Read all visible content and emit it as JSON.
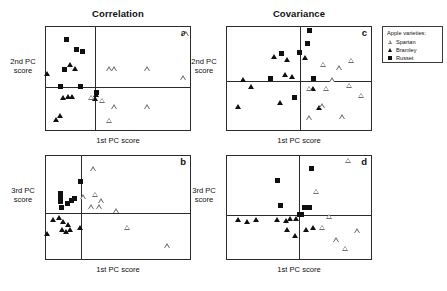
{
  "figure": {
    "column_titles": [
      {
        "label": "Correlation"
      },
      {
        "label": "Covariance"
      }
    ],
    "x_axis_label": "1st PC score",
    "y_axis_label_top": "2nd PC\nscore",
    "y_axis_label_top_line1": "2nd PC",
    "y_axis_label_top_line2": "score",
    "y_axis_label_bottom_line1": "3rd PC",
    "y_axis_label_bottom_line2": "score"
  },
  "legend": {
    "title": "Apple varieties:",
    "entries": [
      {
        "label": "Spartan",
        "marker": "open-triangle-icon",
        "color": "#777777"
      },
      {
        "label": "Bramley",
        "marker": "filled-triangle-icon",
        "color": "#101010"
      },
      {
        "label": "Russet",
        "marker": "filled-square-icon",
        "color": "#101010"
      }
    ]
  },
  "chart_data": [
    {
      "id": "a",
      "type": "scatter",
      "title": "Correlation",
      "panel_label": "a",
      "xlabel": "1st PC score",
      "ylabel": "2nd PC score",
      "xlim": [
        0,
        100
      ],
      "ylim": [
        0,
        100
      ],
      "origin": {
        "x": 34,
        "y": 58
      },
      "grid": false,
      "series": [
        {
          "name": "Russet",
          "marker": "filled-square",
          "points": [
            [
              14,
              12
            ],
            [
              21,
              22
            ],
            [
              25,
              24
            ],
            [
              13,
              41
            ],
            [
              10,
              58
            ],
            [
              24,
              58
            ],
            [
              35,
              64
            ]
          ]
        },
        {
          "name": "Bramley",
          "marker": "filled-triangle",
          "points": [
            [
              17,
              37
            ],
            [
              20,
              41
            ],
            [
              1,
              46
            ],
            [
              12,
              69
            ],
            [
              15,
              68
            ],
            [
              18,
              68
            ],
            [
              35,
              66
            ],
            [
              34,
              70
            ],
            [
              7,
              90
            ],
            [
              10,
              87
            ]
          ]
        },
        {
          "name": "Spartan",
          "marker": "open-triangle",
          "points": [
            [
              44,
              41
            ],
            [
              47,
              41
            ],
            [
              70,
              41
            ],
            [
              95,
              50
            ],
            [
              97,
              7
            ],
            [
              31,
              69
            ],
            [
              39,
              72
            ],
            [
              47,
              78
            ],
            [
              70,
              78
            ],
            [
              44,
              91
            ]
          ]
        }
      ]
    },
    {
      "id": "c",
      "type": "scatter",
      "title": "Covariance",
      "panel_label": "c",
      "xlabel": "1st PC score",
      "ylabel": "2nd PC score",
      "xlim": [
        0,
        100
      ],
      "ylim": [
        0,
        100
      ],
      "origin": {
        "x": 51,
        "y": 52
      },
      "grid": false,
      "series": [
        {
          "name": "Russet",
          "marker": "filled-square",
          "points": [
            [
              57,
              3
            ],
            [
              56,
              16
            ],
            [
              38,
              26
            ],
            [
              50,
              25
            ],
            [
              30,
              50
            ],
            [
              60,
              50
            ],
            [
              47,
              68
            ]
          ]
        },
        {
          "name": "Bramley",
          "marker": "filled-triangle",
          "points": [
            [
              33,
              29
            ],
            [
              42,
              32
            ],
            [
              54,
              30
            ],
            [
              40,
              47
            ],
            [
              45,
              49
            ],
            [
              11,
              52
            ],
            [
              17,
              58
            ],
            [
              60,
              60
            ],
            [
              37,
              74
            ],
            [
              8,
              78
            ],
            [
              64,
              79
            ]
          ]
        },
        {
          "name": "Spartan",
          "marker": "open-triangle",
          "points": [
            [
              67,
              37
            ],
            [
              78,
              40
            ],
            [
              86,
              33
            ],
            [
              73,
              52
            ],
            [
              57,
              60
            ],
            [
              69,
              60
            ],
            [
              85,
              57
            ],
            [
              93,
              67
            ],
            [
              66,
              77
            ],
            [
              57,
              89
            ],
            [
              80,
              88
            ]
          ]
        }
      ]
    },
    {
      "id": "b",
      "type": "scatter",
      "title": "Correlation",
      "panel_label": "b",
      "xlabel": "1st PC score",
      "ylabel": "3rd PC score",
      "xlim": [
        0,
        100
      ],
      "ylim": [
        0,
        100
      ],
      "origin": {
        "x": 24,
        "y": 55
      },
      "grid": false,
      "series": [
        {
          "name": "Russet",
          "marker": "filled-square",
          "points": [
            [
              24,
              25
            ],
            [
              10,
              36
            ],
            [
              10,
              40
            ],
            [
              10,
              44
            ],
            [
              15,
              46
            ],
            [
              18,
              43
            ],
            [
              20,
              41
            ],
            [
              11,
              50
            ]
          ]
        },
        {
          "name": "Bramley",
          "marker": "filled-triangle",
          "points": [
            [
              5,
              62
            ],
            [
              9,
              60
            ],
            [
              12,
              64
            ],
            [
              15,
              67
            ],
            [
              11,
              72
            ],
            [
              14,
              74
            ],
            [
              17,
              72
            ],
            [
              1,
              76
            ],
            [
              24,
              70
            ]
          ]
        },
        {
          "name": "Spartan",
          "marker": "open-triangle",
          "points": [
            [
              33,
              13
            ],
            [
              26,
              40
            ],
            [
              34,
              38
            ],
            [
              38,
              44
            ],
            [
              31,
              50
            ],
            [
              37,
              50
            ],
            [
              49,
              54
            ],
            [
              56,
              70
            ],
            [
              84,
              88
            ]
          ]
        }
      ]
    },
    {
      "id": "d",
      "type": "scatter",
      "title": "Covariance",
      "panel_label": "d",
      "xlabel": "1st PC score",
      "ylabel": "3rd PC score",
      "xlim": [
        0,
        100
      ],
      "ylim": [
        0,
        100
      ],
      "origin": {
        "x": 50,
        "y": 57
      },
      "grid": false,
      "series": [
        {
          "name": "Russet",
          "marker": "filled-square",
          "points": [
            [
              35,
              24
            ],
            [
              37,
              48
            ],
            [
              59,
              12
            ],
            [
              54,
              50
            ],
            [
              57,
              50
            ],
            [
              50,
              57
            ],
            [
              52,
              57
            ]
          ]
        },
        {
          "name": "Bramley",
          "marker": "filled-triangle",
          "points": [
            [
              8,
              62
            ],
            [
              14,
              64
            ],
            [
              20,
              62
            ],
            [
              35,
              62
            ],
            [
              41,
              63
            ],
            [
              44,
              61
            ],
            [
              48,
              61
            ],
            [
              42,
              72
            ],
            [
              47,
              78
            ],
            [
              55,
              72
            ],
            [
              60,
              70
            ]
          ]
        },
        {
          "name": "Spartan",
          "marker": "open-triangle",
          "points": [
            [
              84,
              5
            ],
            [
              62,
              35
            ],
            [
              71,
              59
            ],
            [
              66,
              70
            ],
            [
              90,
              73
            ],
            [
              76,
              82
            ],
            [
              82,
              90
            ]
          ]
        }
      ]
    }
  ]
}
